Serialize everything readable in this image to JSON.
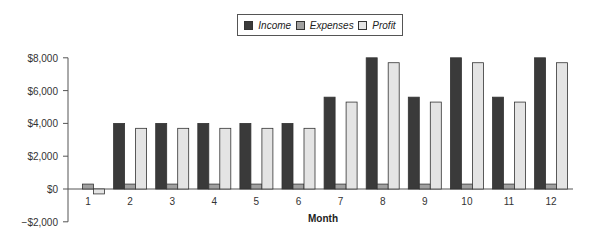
{
  "legend": {
    "items": [
      {
        "label": "Income",
        "color": "#3a3a3a"
      },
      {
        "label": "Expenses",
        "color": "#a0a0a0"
      },
      {
        "label": "Profit",
        "color": "#e4e4e4"
      }
    ]
  },
  "axes": {
    "xlabel": "Month",
    "yticks": [
      "$8,000",
      "$6,000",
      "$4,000",
      "$2,000",
      "$0",
      "−$2,000"
    ],
    "xticks": [
      "1",
      "2",
      "3",
      "4",
      "5",
      "6",
      "7",
      "8",
      "9",
      "10",
      "11",
      "12"
    ]
  },
  "chart_data": {
    "type": "bar",
    "title": "",
    "xlabel": "Month",
    "ylabel": "",
    "ylim": [
      -2000,
      8000
    ],
    "categories": [
      "1",
      "2",
      "3",
      "4",
      "5",
      "6",
      "7",
      "8",
      "9",
      "10",
      "11",
      "12"
    ],
    "series": [
      {
        "name": "Income",
        "values": [
          0,
          4000,
          4000,
          4000,
          4000,
          4000,
          5600,
          8000,
          5600,
          8000,
          5600,
          8000
        ]
      },
      {
        "name": "Expenses",
        "values": [
          300,
          300,
          300,
          300,
          300,
          300,
          300,
          300,
          300,
          300,
          300,
          300
        ]
      },
      {
        "name": "Profit",
        "values": [
          -300,
          3700,
          3700,
          3700,
          3700,
          3700,
          5300,
          7700,
          5300,
          7700,
          5300,
          7700
        ]
      }
    ],
    "legend_position": "top",
    "grid": false
  }
}
